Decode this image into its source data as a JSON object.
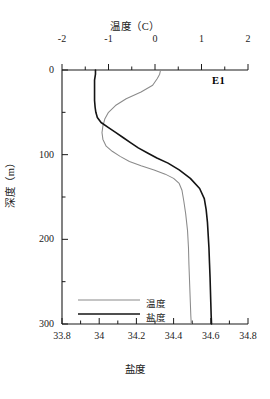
{
  "chart_data": {
    "type": "line",
    "title": "",
    "station": "E1",
    "orientation": "vertical-profile",
    "grid": false,
    "legend_position": "bottom-left",
    "axes": {
      "top": {
        "label": "温度（C）",
        "name": "temperature",
        "unit": "C",
        "lim": [
          -2,
          2
        ],
        "ticks": [
          -2,
          -1,
          0,
          1,
          2
        ],
        "tick_labels": [
          "-2",
          "-1",
          "0",
          "1",
          "2"
        ],
        "minor_ticks": [
          -1.5,
          -0.5,
          0.5,
          1.5
        ]
      },
      "bottom": {
        "label": "盐度",
        "name": "salinity",
        "unit": "",
        "lim": [
          33.8,
          34.8
        ],
        "ticks": [
          33.8,
          34.0,
          34.2,
          34.4,
          34.6,
          34.8
        ],
        "tick_labels": [
          "33.8",
          "34",
          "34.2",
          "34.4",
          "34.6",
          "34.8"
        ],
        "minor_ticks": [
          33.9,
          34.1,
          34.3,
          34.5,
          34.7
        ]
      },
      "left": {
        "label": "深度（m）",
        "name": "depth",
        "unit": "m",
        "lim": [
          0,
          300
        ],
        "inverted": true,
        "ticks": [
          0,
          100,
          200,
          300
        ],
        "tick_labels": [
          "0",
          "100",
          "200",
          "300"
        ],
        "minor_ticks": [
          50,
          150,
          250
        ]
      }
    },
    "series": [
      {
        "name": "温度",
        "key": "temperature",
        "color": "#8a8a8a",
        "axis": "top",
        "x": [
          0.12,
          0.1,
          0.05,
          -0.05,
          -0.3,
          -0.62,
          -0.85,
          -1.0,
          -1.08,
          -1.12,
          -1.14,
          -1.12,
          -1.05,
          -0.92,
          -0.75,
          -0.55,
          -0.3,
          -0.02,
          0.22,
          0.4,
          0.52,
          0.58,
          0.62,
          0.66,
          0.7,
          0.72,
          0.73,
          0.74,
          0.75,
          0.76,
          0.77,
          0.78
        ],
        "y": [
          0,
          5,
          10,
          18,
          26,
          34,
          42,
          50,
          58,
          66,
          74,
          82,
          90,
          96,
          102,
          108,
          113,
          118,
          123,
          128,
          134,
          142,
          155,
          170,
          190,
          210,
          230,
          245,
          260,
          275,
          290,
          300
        ]
      },
      {
        "name": "盐度",
        "key": "salinity",
        "color": "#141414",
        "axis": "bottom",
        "x": [
          33.98,
          33.98,
          33.975,
          33.975,
          33.975,
          33.975,
          33.978,
          33.982,
          33.99,
          34.01,
          34.05,
          34.09,
          34.13,
          34.17,
          34.21,
          34.26,
          34.31,
          34.37,
          34.43,
          34.49,
          34.54,
          34.565,
          34.575,
          34.582,
          34.586,
          34.59,
          34.593,
          34.596,
          34.598,
          34.6,
          34.602,
          34.604
        ],
        "y": [
          0,
          5,
          12,
          20,
          28,
          36,
          44,
          50,
          56,
          62,
          68,
          74,
          80,
          86,
          92,
          98,
          104,
          110,
          118,
          128,
          140,
          152,
          165,
          180,
          195,
          210,
          228,
          245,
          260,
          275,
          290,
          300
        ]
      }
    ],
    "legend": [
      {
        "label": "温度",
        "color": "#8a8a8a"
      },
      {
        "label": "盐度",
        "color": "#141414"
      }
    ]
  }
}
